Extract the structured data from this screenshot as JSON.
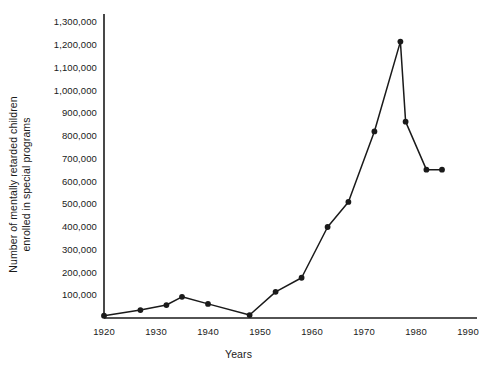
{
  "chart_data": {
    "type": "line",
    "title": "",
    "subtitle": "",
    "xlabel": "Years",
    "ylabel": "Number of mentally retarded children enrolled in special programs",
    "ylabel_lines": [
      "Number of mentally retarded children",
      "enrolled in special programs"
    ],
    "x": [
      1920,
      1927,
      1932,
      1935,
      1940,
      1948,
      1953,
      1958,
      1963,
      1967,
      1972,
      1977,
      1978,
      1982,
      1985
    ],
    "values": [
      10000,
      35000,
      57000,
      93000,
      62000,
      13000,
      115000,
      177000,
      400000,
      510000,
      820000,
      1215000,
      863000,
      652000,
      652000
    ],
    "points": [
      {
        "x": 1920,
        "y": 10000
      },
      {
        "x": 1927,
        "y": 35000
      },
      {
        "x": 1932,
        "y": 57000
      },
      {
        "x": 1935,
        "y": 93000
      },
      {
        "x": 1940,
        "y": 62000
      },
      {
        "x": 1948,
        "y": 13000
      },
      {
        "x": 1953,
        "y": 115000
      },
      {
        "x": 1958,
        "y": 177000
      },
      {
        "x": 1963,
        "y": 400000
      },
      {
        "x": 1967,
        "y": 510000
      },
      {
        "x": 1972,
        "y": 820000
      },
      {
        "x": 1977,
        "y": 1215000
      },
      {
        "x": 1978,
        "y": 863000
      },
      {
        "x": 1982,
        "y": 652000
      },
      {
        "x": 1985,
        "y": 652000
      }
    ],
    "xlim": [
      1918,
      1992
    ],
    "ylim": [
      0,
      1330000
    ],
    "xticks": [
      1920,
      1930,
      1940,
      1950,
      1960,
      1970,
      1980,
      1990
    ],
    "xticklabels": [
      "1920",
      "1930",
      "1940",
      "1950",
      "1960",
      "1970",
      "1980",
      "1990"
    ],
    "yticks": [
      100000,
      200000,
      300000,
      400000,
      500000,
      600000,
      700000,
      800000,
      900000,
      1000000,
      1100000,
      1200000,
      1300000
    ],
    "yticklabels": [
      "100,000",
      "200,000",
      "300,000",
      "400,000",
      "500,000",
      "600,000",
      "700,000",
      "800,000",
      "900,000",
      "1,000,000",
      "1,100,000",
      "1,200,000",
      "1,300,000"
    ],
    "grid": false,
    "legend": false,
    "legend_position": "none",
    "series_color": "#1a1a1a",
    "marker": "circle",
    "background_color": "#ffffff",
    "axis_color": "#1a1a1a"
  }
}
